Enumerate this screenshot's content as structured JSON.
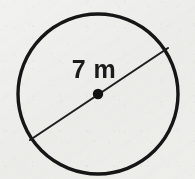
{
  "figure": {
    "kind": "geometry-diagram",
    "background_color": "#f1f1ef",
    "ink_color": "#161616",
    "width": 195,
    "height": 179
  },
  "labels": {
    "measurement": "7 m",
    "measurement_value": 7,
    "measurement_unit": "m",
    "measurement_x": 94,
    "measurement_y": 78
  },
  "shapes": {
    "circle": {
      "name": "circle-outline",
      "cx": 98,
      "cy": 94,
      "r": 80,
      "stroke": "#161616",
      "stroke_width": 3.4,
      "fill": "none"
    },
    "diameter": {
      "name": "diameter-line",
      "x1": 30,
      "y1": 140,
      "x2": 168,
      "y2": 48,
      "stroke": "#1d1d1d",
      "stroke_width": 2.1
    },
    "center_point": {
      "name": "center-point-dot",
      "cx": 98,
      "cy": 94,
      "r": 5.2,
      "fill": "#111111"
    }
  }
}
